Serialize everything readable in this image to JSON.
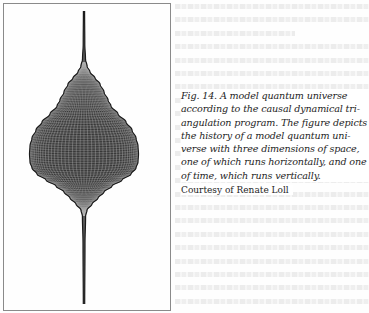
{
  "figure": {
    "label": "Fig. 14.",
    "caption_lines": [
      "Fig. 14. A model quantum universe",
      "according to the causal dynamical tri-",
      "angulation program. The figure depicts",
      "the history of a model quantum uni-",
      "verse with three dimensions of space,",
      "one of which runs horizontally, and one",
      "of time, which runs vertically."
    ],
    "credit": "Courtesy of Renate Loll",
    "illustration": "quantum-universe-surface",
    "colors": {
      "mesh": "#2a2a2a",
      "box_border": "#8a8a8a",
      "text": "#1e1e1e"
    }
  }
}
